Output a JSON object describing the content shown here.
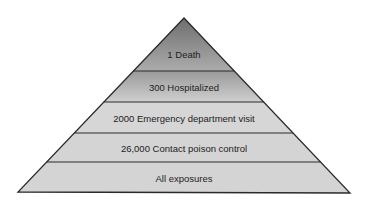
{
  "diagram": {
    "type": "pyramid",
    "tiers": [
      {
        "label": "1 Death",
        "fill_top": "#6e6e6e",
        "fill_bottom": "#acacac"
      },
      {
        "label": "300 Hospitalized",
        "fill_top": "#9a9a9a",
        "fill_bottom": "#cfcfcf"
      },
      {
        "label": "2000 Emergency department visit",
        "fill_top": "#d6d6d6",
        "fill_bottom": "#d6d6d6"
      },
      {
        "label": "26,000 Contact poison control",
        "fill_top": "#d6d6d6",
        "fill_bottom": "#d6d6d6"
      },
      {
        "label": "All exposures",
        "fill_top": "#d6d6d6",
        "fill_bottom": "#d6d6d6"
      }
    ],
    "outline_color": "#2a2a2a",
    "background": "#ffffff"
  }
}
